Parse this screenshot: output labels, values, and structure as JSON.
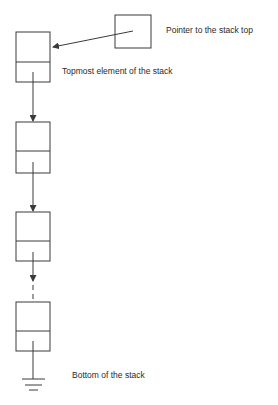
{
  "diagram": {
    "labels": {
      "pointer": "Pointer to the stack top",
      "topmost": "Topmost element of the stack",
      "bottom": "Bottom of the stack"
    },
    "colors": {
      "stroke": "#3a3a3a",
      "text": "#2a2a2a",
      "background": "#ffffff"
    },
    "nodes": [
      {
        "id": "top-pointer",
        "role": "pointer",
        "x": 115,
        "y": 15,
        "w": 36,
        "h": 33
      },
      {
        "id": "node-1",
        "role": "topmost",
        "x": 16,
        "y": 32,
        "w": 34,
        "h": 50,
        "divider_y": 62
      },
      {
        "id": "node-2",
        "role": "middle",
        "x": 16,
        "y": 122,
        "w": 34,
        "h": 51,
        "divider_y": 151
      },
      {
        "id": "node-3",
        "role": "middle",
        "x": 16,
        "y": 212,
        "w": 34,
        "h": 49,
        "divider_y": 241
      },
      {
        "id": "node-4",
        "role": "bottom",
        "x": 16,
        "y": 302,
        "w": 34,
        "h": 49,
        "divider_y": 331
      }
    ],
    "edges": [
      {
        "from": "top-pointer",
        "to": "node-1",
        "style": "solid-arrow"
      },
      {
        "from": "node-1",
        "to": "node-2",
        "style": "solid-arrow"
      },
      {
        "from": "node-2",
        "to": "node-3",
        "style": "solid-arrow"
      },
      {
        "from": "node-3",
        "to": "node-4",
        "style": "arrow-then-dashed"
      },
      {
        "from": "node-4",
        "to": "ground",
        "style": "null-terminator"
      }
    ]
  }
}
